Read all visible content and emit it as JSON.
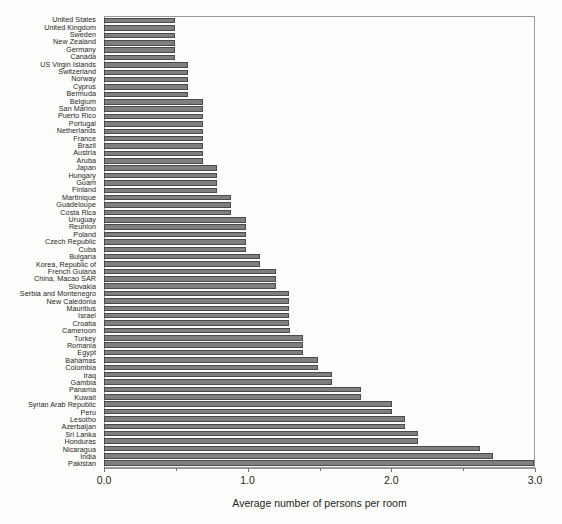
{
  "chart_data": {
    "type": "bar",
    "orientation": "horizontal",
    "title": "",
    "xlabel": "Average number of persons per room",
    "ylabel": "",
    "xlim": [
      0.0,
      3.0
    ],
    "xticks": [
      0.0,
      1.0,
      2.0,
      3.0
    ],
    "xtick_labels": [
      "0.0",
      "1.0",
      "2.0",
      "3.0"
    ],
    "grid": false,
    "legend": false,
    "bar_color": "#7f7f7f",
    "bar_edge_color": "#4a4a4a",
    "categories": [
      "United States",
      "United Kingdom",
      "Sweden",
      "New Zealand",
      "Germany",
      "Canada",
      "US Virgin Islands",
      "Switzerland",
      "Norway",
      "Cyprus",
      "Bermuda",
      "Belgium",
      "San Marino",
      "Puerto Rico",
      "Portugal",
      "Netherlands",
      "France",
      "Brazil",
      "Austria",
      "Aruba",
      "Japan",
      "Hungary",
      "Guam",
      "Finland",
      "Martinique",
      "Guadeloupe",
      "Costa Rica",
      "Uruguay",
      "Reunion",
      "Poland",
      "Czech Republic",
      "Cuba",
      "Bulgaria",
      "Korea, Republic of",
      "French Guiana",
      "China, Macao SAR",
      "Slovakia",
      "Serbia and Montenegro",
      "New Caledonia",
      "Mauritius",
      "Israel",
      "Croatia",
      "Cameroon",
      "Turkey",
      "Romania",
      "Egypt",
      "Bahamas",
      "Colombia",
      "Iraq",
      "Gambia",
      "Panama",
      "Kuwait",
      "Syrian Arab Republic",
      "Peru",
      "Lesotho",
      "Azerbaijan",
      "Sri Lanka",
      "Honduras",
      "Nicaragua",
      "India",
      "Pakistan"
    ],
    "values": [
      0.49,
      0.49,
      0.49,
      0.49,
      0.49,
      0.49,
      0.58,
      0.58,
      0.58,
      0.58,
      0.58,
      0.68,
      0.68,
      0.68,
      0.68,
      0.68,
      0.68,
      0.68,
      0.68,
      0.68,
      0.78,
      0.78,
      0.78,
      0.78,
      0.88,
      0.88,
      0.88,
      0.98,
      0.98,
      0.98,
      0.98,
      0.98,
      1.08,
      1.08,
      1.19,
      1.19,
      1.19,
      1.28,
      1.28,
      1.28,
      1.28,
      1.28,
      1.29,
      1.38,
      1.38,
      1.38,
      1.48,
      1.48,
      1.58,
      1.58,
      1.78,
      1.78,
      2.0,
      2.0,
      2.09,
      2.09,
      2.18,
      2.18,
      2.61,
      2.7,
      3.0
    ]
  }
}
